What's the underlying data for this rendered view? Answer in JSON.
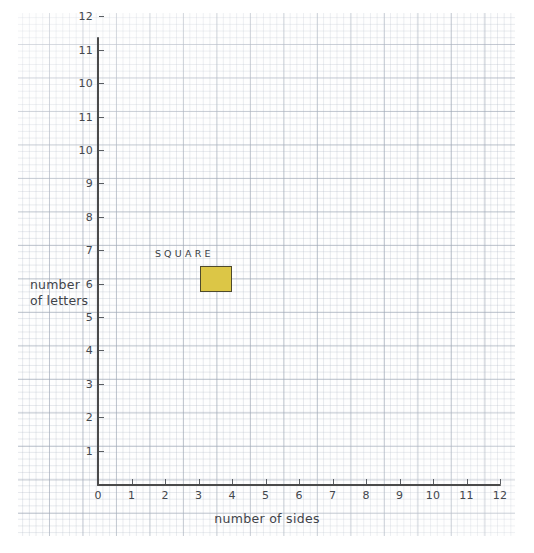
{
  "chart_data": {
    "type": "scatter",
    "title": "",
    "xlabel": "number of sides",
    "ylabel": "number of letters",
    "xlim": [
      0,
      12
    ],
    "ylim": [
      0,
      12
    ],
    "grid": true,
    "legend": "none",
    "x_ticks": [
      "0",
      "1",
      "2",
      "3",
      "4",
      "5",
      "6",
      "7",
      "8",
      "9",
      "10",
      "11",
      "12"
    ],
    "y_ticks": [
      "1",
      "2",
      "3",
      "4",
      "5",
      "6",
      "7",
      "8",
      "9",
      "10",
      "11",
      "10",
      "11",
      "12"
    ],
    "points": [
      {
        "label": "SQUARE",
        "x": 4,
        "y": 6,
        "marker": "filled-square",
        "fill": "#dcc646",
        "stroke": "#4e4a2c"
      }
    ],
    "annotations": [
      {
        "text": "SQUARE",
        "x": 3.4,
        "y": 6.6
      }
    ]
  },
  "axes": {
    "x_label": "number of sides",
    "y_label_line1": "number",
    "y_label_line2": "of letters"
  },
  "colors": {
    "axis": "#4a4a4a",
    "grid_major": "#96a0af",
    "grid_minor": "#a8b2c0",
    "marker_fill": "#dcc646",
    "marker_stroke": "#4e4a2c",
    "text": "#3f4349",
    "paper": "#fefefe"
  }
}
